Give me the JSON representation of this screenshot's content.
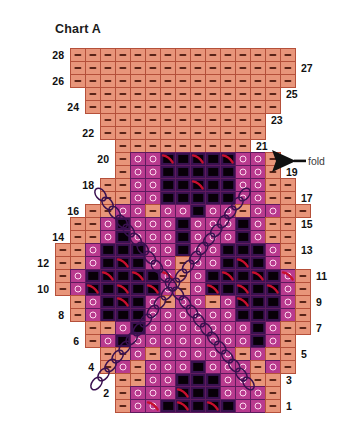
{
  "title": "Chart A",
  "fold": {
    "label": "fold",
    "arrow_icon": "left-arrow-icon",
    "at_row": 20
  },
  "row_numbers": {
    "left": [
      28,
      26,
      24,
      22,
      20,
      18,
      16,
      14,
      12,
      10,
      8,
      6,
      4,
      2
    ],
    "right": [
      27,
      25,
      23,
      21,
      19,
      17,
      15,
      13,
      11,
      9,
      7,
      5,
      3,
      1
    ]
  },
  "colors": {
    "background": "#ffffff",
    "salmon": "#e8957a",
    "salmon_border": "#b5503a",
    "magenta": "#b83a8e",
    "magenta_border": "#5f1a5e",
    "dark_purple": "#3a1150",
    "black_symbol": "#080008",
    "red_swirl": "#c8102e",
    "cable_line": "#3a1150",
    "text": "#111111",
    "fold_text": "#3a3a3a"
  },
  "legend_symbols": {
    "dash": "purl / garter stitch (dash on salmon)",
    "circle": "yarn over (open circle on magenta)",
    "square": "colorwork block (black square on dark purple)",
    "swirl": "decrease / twisted stitch (red swirl)"
  },
  "chart_data": {
    "type": "heatmap",
    "title": "Chart A",
    "xlabel": "",
    "ylabel": "",
    "rows": 28,
    "max_columns": 17,
    "grid_note": "Row 1 is bottom. Value legend: 0 = empty (no stitch), 1 = dash on salmon, 2 = circle on magenta, 3 = black square on dark purple.",
    "value_legend": {
      "0": "empty",
      "1": "dash",
      "2": "circle",
      "3": "square"
    },
    "cell_width": 15,
    "cell_height": 13,
    "origin_x": 55,
    "origin_y": 48,
    "grid": [
      [
        0,
        1,
        1,
        1,
        1,
        1,
        1,
        1,
        1,
        1,
        1,
        1,
        1,
        1,
        1,
        1,
        0
      ],
      [
        0,
        1,
        1,
        1,
        1,
        1,
        1,
        1,
        1,
        1,
        1,
        1,
        1,
        1,
        1,
        1,
        0
      ],
      [
        0,
        1,
        1,
        1,
        1,
        1,
        1,
        1,
        1,
        1,
        1,
        1,
        1,
        1,
        1,
        1,
        0
      ],
      [
        0,
        0,
        1,
        1,
        1,
        1,
        1,
        1,
        1,
        1,
        1,
        1,
        1,
        1,
        1,
        0,
        0
      ],
      [
        0,
        0,
        1,
        1,
        1,
        1,
        1,
        1,
        1,
        1,
        1,
        1,
        1,
        1,
        1,
        0,
        0
      ],
      [
        0,
        0,
        0,
        1,
        1,
        1,
        1,
        1,
        1,
        1,
        1,
        1,
        1,
        1,
        0,
        0,
        0
      ],
      [
        0,
        0,
        0,
        1,
        1,
        1,
        1,
        1,
        1,
        1,
        1,
        1,
        1,
        1,
        0,
        0,
        0
      ],
      [
        0,
        0,
        0,
        0,
        1,
        1,
        1,
        1,
        1,
        1,
        1,
        1,
        1,
        0,
        0,
        0,
        0
      ],
      [
        0,
        0,
        0,
        0,
        1,
        2,
        2,
        3,
        3,
        3,
        3,
        3,
        2,
        2,
        1,
        0,
        0,
        0
      ],
      [
        0,
        0,
        0,
        0,
        1,
        2,
        2,
        3,
        3,
        3,
        3,
        3,
        2,
        2,
        1,
        0,
        0,
        0
      ],
      [
        0,
        0,
        0,
        1,
        1,
        2,
        2,
        3,
        3,
        3,
        3,
        3,
        2,
        2,
        1,
        1,
        0
      ],
      [
        0,
        0,
        0,
        1,
        1,
        2,
        2,
        3,
        3,
        3,
        3,
        3,
        2,
        2,
        1,
        1,
        0
      ],
      [
        0,
        0,
        1,
        1,
        2,
        2,
        1,
        2,
        2,
        3,
        2,
        2,
        1,
        2,
        2,
        1,
        1
      ],
      [
        0,
        1,
        1,
        2,
        3,
        2,
        2,
        2,
        3,
        2,
        2,
        2,
        3,
        2,
        1,
        1,
        0
      ],
      [
        0,
        1,
        1,
        2,
        3,
        2,
        2,
        2,
        3,
        2,
        2,
        2,
        3,
        2,
        1,
        1,
        0
      ],
      [
        1,
        1,
        2,
        3,
        3,
        3,
        2,
        2,
        3,
        2,
        2,
        3,
        3,
        3,
        2,
        1,
        0
      ],
      [
        1,
        1,
        2,
        3,
        3,
        3,
        2,
        2,
        1,
        2,
        2,
        3,
        3,
        3,
        2,
        1,
        0
      ],
      [
        1,
        2,
        3,
        3,
        3,
        3,
        3,
        2,
        1,
        2,
        3,
        3,
        3,
        3,
        3,
        2,
        1
      ],
      [
        1,
        2,
        3,
        3,
        3,
        3,
        3,
        2,
        1,
        2,
        3,
        3,
        3,
        3,
        3,
        2,
        1
      ],
      [
        0,
        1,
        2,
        3,
        3,
        3,
        2,
        1,
        2,
        2,
        1,
        2,
        3,
        3,
        3,
        2,
        1
      ],
      [
        0,
        1,
        2,
        3,
        3,
        3,
        2,
        2,
        2,
        2,
        2,
        2,
        3,
        3,
        3,
        2,
        1
      ],
      [
        0,
        0,
        1,
        1,
        2,
        3,
        2,
        2,
        2,
        2,
        2,
        2,
        2,
        3,
        2,
        1,
        1
      ],
      [
        0,
        0,
        1,
        2,
        3,
        2,
        2,
        2,
        2,
        2,
        2,
        2,
        2,
        3,
        2,
        1,
        0
      ],
      [
        0,
        0,
        0,
        1,
        1,
        2,
        1,
        2,
        2,
        2,
        2,
        2,
        1,
        2,
        1,
        1,
        0
      ],
      [
        0,
        0,
        0,
        1,
        2,
        1,
        2,
        2,
        2,
        3,
        2,
        2,
        2,
        1,
        2,
        1,
        0
      ],
      [
        0,
        0,
        0,
        0,
        1,
        1,
        2,
        2,
        3,
        3,
        3,
        2,
        2,
        1,
        1,
        0,
        0
      ],
      [
        0,
        0,
        0,
        0,
        1,
        2,
        2,
        2,
        3,
        3,
        3,
        2,
        2,
        2,
        1,
        0,
        0
      ],
      [
        0,
        0,
        0,
        0,
        1,
        2,
        2,
        3,
        3,
        3,
        3,
        3,
        2,
        2,
        1,
        0,
        0
      ]
    ],
    "swirl_cells": [
      {
        "row": 20,
        "col": 8
      },
      {
        "row": 20,
        "col": 10
      },
      {
        "row": 20,
        "col": 12
      },
      {
        "row": 18,
        "col": 10
      },
      {
        "row": 12,
        "col": 5
      },
      {
        "row": 12,
        "col": 13
      },
      {
        "row": 11,
        "col": 4
      },
      {
        "row": 11,
        "col": 6
      },
      {
        "row": 11,
        "col": 8
      },
      {
        "row": 11,
        "col": 12
      },
      {
        "row": 11,
        "col": 14
      },
      {
        "row": 11,
        "col": 16
      },
      {
        "row": 10,
        "col": 3
      },
      {
        "row": 10,
        "col": 5
      },
      {
        "row": 10,
        "col": 7
      },
      {
        "row": 10,
        "col": 11
      },
      {
        "row": 10,
        "col": 13
      },
      {
        "row": 10,
        "col": 15
      },
      {
        "row": 9,
        "col": 5
      },
      {
        "row": 9,
        "col": 13
      },
      {
        "row": 2,
        "col": 9
      },
      {
        "row": 1,
        "col": 7
      },
      {
        "row": 1,
        "col": 9
      },
      {
        "row": 1,
        "col": 11
      }
    ],
    "cable_lines": [
      {
        "name": "left-to-right-diagonal",
        "from": [
          97,
          190
        ],
        "to": [
          252,
          388
        ]
      },
      {
        "name": "right-to-left-diagonal",
        "from": [
          248,
          190
        ],
        "to": [
          93,
          388
        ]
      }
    ]
  }
}
